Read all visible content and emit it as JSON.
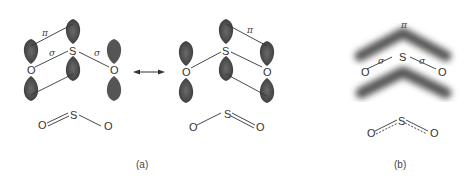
{
  "figure": {
    "panel_a": {
      "caption": "(a)",
      "resonance_arrow": "double-headed-arrow",
      "structure_1": {
        "atoms": {
          "o_left": "O",
          "s": "S",
          "o_right": "O"
        },
        "labels": {
          "pi": "π",
          "sigma_left": "σ",
          "sigma_right": "σ"
        },
        "lewis": {
          "o_left": "O",
          "s": "S",
          "o_right": "O",
          "bonds": [
            "double",
            "single"
          ]
        }
      },
      "structure_2": {
        "atoms": {
          "o_left": "O",
          "s": "S",
          "o_right": "O"
        },
        "labels": {
          "pi": "π"
        },
        "lewis": {
          "o_left": "O",
          "s": "S",
          "o_right": "O",
          "bonds": [
            "single",
            "double"
          ]
        }
      }
    },
    "panel_b": {
      "caption": "(b)",
      "atoms": {
        "o_left": "O",
        "s": "S",
        "o_right": "O"
      },
      "labels": {
        "pi": "π",
        "sigma_left": "σ",
        "sigma_right": "σ"
      },
      "lewis": {
        "o_left": "O",
        "s": "S",
        "o_right": "O",
        "bonds": [
          "delocalized",
          "delocalized"
        ]
      }
    },
    "colors": {
      "lobe": "#4a4a4a",
      "lobe_light": "#8a8a8a",
      "line": "#333333",
      "background": "#ffffff"
    }
  }
}
